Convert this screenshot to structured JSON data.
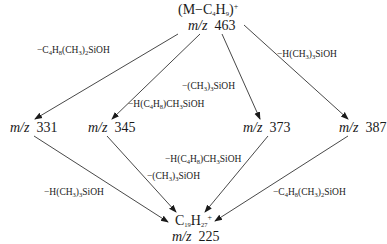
{
  "diagram": {
    "type": "fragmentation-scheme",
    "nodes": {
      "parent": {
        "formula": "(M−C4H9)+",
        "mz_label": "m/z",
        "mz": "463"
      },
      "n331": {
        "mz_label": "m/z",
        "mz": "331"
      },
      "n345": {
        "mz_label": "m/z",
        "mz": "345"
      },
      "n373": {
        "mz_label": "m/z",
        "mz": "373"
      },
      "n387": {
        "mz_label": "m/z",
        "mz": "387"
      },
      "product": {
        "formula": "C19H27+",
        "mz_label": "m/z",
        "mz": "225"
      }
    },
    "edges": [
      {
        "from": "463",
        "to": "331",
        "loss": "−C4H8(CH3)2SiOH"
      },
      {
        "from": "463",
        "to": "345",
        "loss": "−H(C4H8)CH3SiOH"
      },
      {
        "from": "463",
        "to": "373",
        "loss": "−(CH3)3SiOH"
      },
      {
        "from": "463",
        "to": "387",
        "loss": "−H(CH3)3SiOH"
      },
      {
        "from": "331",
        "to": "225",
        "loss": "−H(CH3)3SiOH"
      },
      {
        "from": "345",
        "to": "225",
        "loss": "−(CH3)3SiOH"
      },
      {
        "from": "373",
        "to": "225",
        "loss": "−H(C4H8)CH3SiOH"
      },
      {
        "from": "387",
        "to": "225",
        "loss": "−C4H8(CH3)2SiOH"
      }
    ]
  }
}
